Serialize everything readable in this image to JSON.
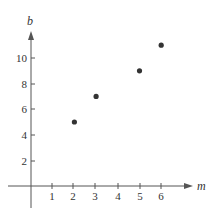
{
  "chart_data": {
    "type": "scatter",
    "title": "",
    "xlabel": "m",
    "ylabel": "b",
    "x": [
      2,
      3,
      5,
      6
    ],
    "series": [
      {
        "name": "points",
        "values": [
          5,
          7,
          9,
          11
        ]
      }
    ],
    "points": [
      {
        "m": 2,
        "b": 5
      },
      {
        "m": 3,
        "b": 7
      },
      {
        "m": 5,
        "b": 9
      },
      {
        "m": 6,
        "b": 11
      }
    ],
    "xticks": [
      1,
      2,
      3,
      4,
      5,
      6
    ],
    "yticks": [
      2,
      4,
      6,
      8,
      10
    ],
    "xlim": [
      -1,
      7
    ],
    "ylim": [
      -2,
      12
    ],
    "grid": false,
    "legend": null,
    "colors": {
      "point": "#333333",
      "axis": "#555555"
    }
  },
  "labels": {
    "x_axis": "m",
    "y_axis": "b",
    "xticks": [
      "1",
      "2",
      "3",
      "4",
      "5",
      "6"
    ],
    "yticks": [
      "2",
      "4",
      "6",
      "8",
      "10"
    ]
  }
}
